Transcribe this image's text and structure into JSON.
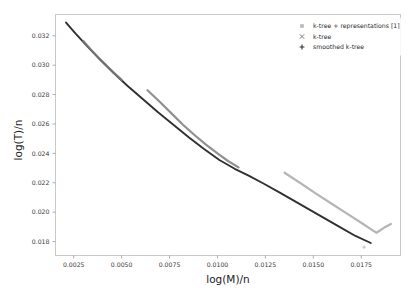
{
  "figure": {
    "background_color": "#ffffff",
    "frame_color": "#c9c9c9"
  },
  "axes": {
    "x": {
      "label": "log(M)/n",
      "ticks": [
        "0.0025",
        "0.0050",
        "0.0075",
        "0.0100",
        "0.0125",
        "0.0150",
        "0.0175"
      ],
      "tick_values": [
        0.0025,
        0.005,
        0.0075,
        0.01,
        0.0125,
        0.015,
        0.0175
      ],
      "limits": [
        0.00155,
        0.01955
      ]
    },
    "y": {
      "label": "log(T)/n",
      "ticks": [
        "0.018",
        "0.020",
        "0.022",
        "0.024",
        "0.026",
        "0.028",
        "0.030",
        "0.032"
      ],
      "tick_values": [
        0.018,
        0.02,
        0.022,
        0.024,
        0.026,
        0.028,
        0.03,
        0.032
      ],
      "limits": [
        0.01705,
        0.03345
      ]
    }
  },
  "legend": {
    "position": "upper-right",
    "entries": [
      {
        "label": "k-tree + representations [1]",
        "marker": "square-marker",
        "color": "#b9b9b9"
      },
      {
        "label": "k-tree",
        "marker": "x-marker",
        "color": "#7d7d7d"
      },
      {
        "label": "smoothed k-tree",
        "marker": "plus-marker",
        "color": "#303030"
      }
    ]
  },
  "chart_data": {
    "type": "line",
    "title": "",
    "xlabel": "log(M)/n",
    "ylabel": "log(T)/n",
    "xlim": [
      0.00155,
      0.01955
    ],
    "ylim": [
      0.01705,
      0.03345
    ],
    "grid": false,
    "legend_position": "upper right",
    "series": [
      {
        "name": "smoothed k-tree",
        "marker": "plus-marker",
        "color": "#303030",
        "points": [
          [
            0.0021,
            0.0329
          ],
          [
            0.0026,
            0.03215
          ],
          [
            0.0032,
            0.0313
          ],
          [
            0.0039,
            0.03035
          ],
          [
            0.0046,
            0.02945
          ],
          [
            0.0053,
            0.0286
          ],
          [
            0.0061,
            0.0277
          ],
          [
            0.0069,
            0.0268
          ],
          [
            0.0077,
            0.02595
          ],
          [
            0.0085,
            0.0251
          ],
          [
            0.0093,
            0.0243
          ],
          [
            0.0101,
            0.02355
          ],
          [
            0.0109,
            0.02295
          ],
          [
            0.0116,
            0.0225
          ],
          [
            0.0124,
            0.02195
          ],
          [
            0.0133,
            0.0213
          ],
          [
            0.0143,
            0.02055
          ],
          [
            0.0153,
            0.0198
          ],
          [
            0.0163,
            0.01905
          ],
          [
            0.0172,
            0.01838
          ],
          [
            0.018,
            0.0179
          ]
        ]
      },
      {
        "name": "k-tree",
        "marker": "x-marker",
        "color": "#7d7d7d",
        "points": [
          [
            0.003,
            0.03165
          ],
          [
            0.0034,
            0.03105
          ],
          [
            0.0038,
            0.0305
          ],
          [
            0.0042,
            0.02998
          ],
          [
            0.0046,
            0.02948
          ],
          [
            0.005,
            0.029
          ]
        ]
      },
      {
        "name": "k-tree-branch-mid",
        "marker": "x-marker",
        "color": "#7d7d7d",
        "points": [
          [
            0.00635,
            0.0283
          ],
          [
            0.007,
            0.0275
          ],
          [
            0.0076,
            0.02672
          ],
          [
            0.0082,
            0.02595
          ],
          [
            0.0088,
            0.02525
          ],
          [
            0.0094,
            0.0246
          ],
          [
            0.01,
            0.024
          ],
          [
            0.01055,
            0.02348
          ],
          [
            0.0111,
            0.02305
          ]
        ]
      },
      {
        "name": "k-tree + representations [1]",
        "marker": "square-marker",
        "color": "#a8a8a8",
        "points": [
          [
            0.0135,
            0.02268
          ],
          [
            0.0143,
            0.022
          ],
          [
            0.0151,
            0.0213
          ],
          [
            0.0159,
            0.02062
          ],
          [
            0.0167,
            0.01995
          ],
          [
            0.0175,
            0.01928
          ],
          [
            0.0182,
            0.01868
          ],
          [
            0.0183,
            0.0186
          ],
          [
            0.0187,
            0.01895
          ],
          [
            0.01905,
            0.0192
          ]
        ]
      }
    ],
    "outlier_points": [
      {
        "x": 0.01765,
        "y": 0.01762,
        "color": "#cfcfcf"
      }
    ]
  }
}
